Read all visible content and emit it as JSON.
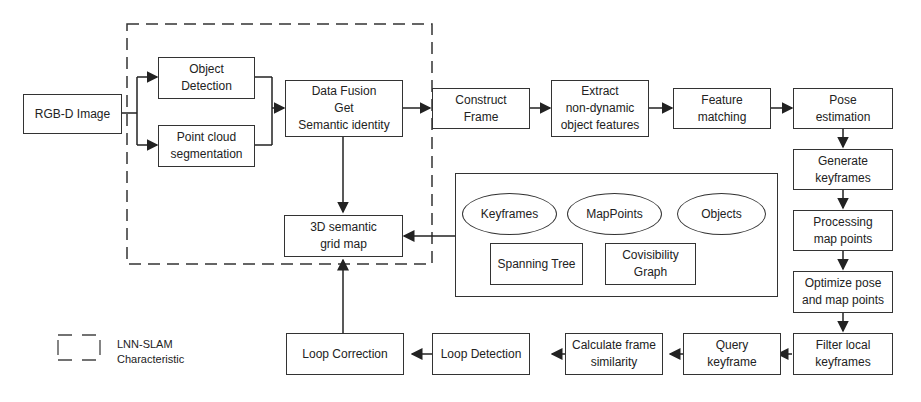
{
  "diagram": {
    "nodes": {
      "rgbd_image": "RGB-D Image",
      "object_detection": "Object\nDetection",
      "point_cloud_segmentation": "Point cloud\nsegmentation",
      "data_fusion": "Data Fusion\nGet\nSemantic identity",
      "construct_frame": "Construct\nFrame",
      "extract_features": "Extract\nnon-dynamic\nobject features",
      "feature_matching": "Feature\nmatching",
      "pose_estimation": "Pose\nestimation",
      "generate_keyframes": "Generate\nkeyframes",
      "processing_map_points": "Processing\nmap points",
      "optimize_pose": "Optimize pose\nand map points",
      "filter_local_keyframes": "Filter local\nkeyframes",
      "query_keyframe": "Query\nkeyframe",
      "calculate_similarity": "Calculate frame\nsimilarity",
      "loop_detection": "Loop Detection",
      "loop_correction": "Loop Correction",
      "semantic_grid_map": "3D semantic\ngrid map"
    },
    "map_container": {
      "ellipses": [
        "Keyframes",
        "MapPoints",
        "Objects"
      ],
      "boxes": [
        "Spanning Tree",
        "Covisibility\nGraph"
      ]
    },
    "legend": {
      "label": "LNN-SLAM\nCharacteristic"
    }
  }
}
